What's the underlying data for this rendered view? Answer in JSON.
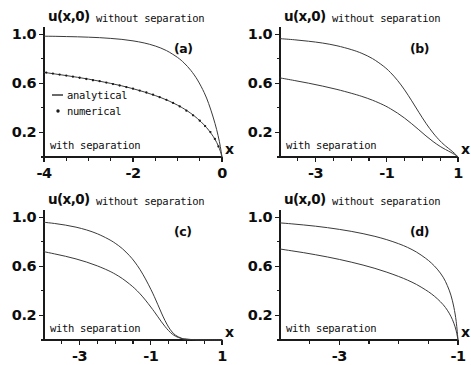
{
  "figure": {
    "background_color": "#ffffff",
    "curve_color": "#3a3a3a",
    "axis_color": "#1a1a1a",
    "text_color": "#0d0d0d"
  },
  "common": {
    "ylabel": "u(x,0)",
    "xlabel": "x",
    "label_without": "without separation",
    "label_with": "with separation",
    "ytick_labels": [
      "1.0",
      "0.6",
      "0.2"
    ],
    "ytick_values": [
      1.0,
      0.6,
      0.2
    ],
    "yminor_values": [
      0.8,
      0.4,
      0.0
    ],
    "ylim": [
      0,
      1.06
    ]
  },
  "legend": {
    "analytical_label": "analytical",
    "numerical_label": "numerical",
    "analytical_marker": "line",
    "numerical_marker": "dot"
  },
  "chart_data": [
    {
      "type": "line",
      "panel": "a",
      "tag": "(a)",
      "title": "",
      "xlabel": "x",
      "ylabel": "u(x,0)",
      "xlim": [
        -4,
        0
      ],
      "ylim": [
        0,
        1.06
      ],
      "xtick_labels": [
        "-4",
        "-2",
        "0"
      ],
      "xtick_values": [
        -4,
        -2,
        0
      ],
      "xminor_values": [
        -3.5,
        -3.0,
        -2.5,
        -1.5,
        -1.0,
        -0.5
      ],
      "grid": false,
      "annotations": [
        "without separation",
        "with separation"
      ],
      "has_legend": true,
      "series": [
        {
          "name": "without separation",
          "style": "analytical",
          "x": [
            -4.0,
            -3.75,
            -3.5,
            -3.25,
            -3.0,
            -2.75,
            -2.5,
            -2.25,
            -2.0,
            -1.75,
            -1.5,
            -1.25,
            -1.0,
            -0.85,
            -0.7,
            -0.55,
            -0.4,
            -0.3,
            -0.2,
            -0.12,
            -0.06,
            -0.02,
            0.0
          ],
          "y": [
            0.985,
            0.984,
            0.982,
            0.98,
            0.977,
            0.973,
            0.967,
            0.959,
            0.947,
            0.93,
            0.905,
            0.868,
            0.812,
            0.766,
            0.706,
            0.628,
            0.525,
            0.436,
            0.326,
            0.223,
            0.128,
            0.047,
            0.0
          ]
        },
        {
          "name": "with separation",
          "style": "analytical",
          "x": [
            -4.0,
            -3.75,
            -3.5,
            -3.25,
            -3.0,
            -2.75,
            -2.5,
            -2.25,
            -2.0,
            -1.75,
            -1.5,
            -1.25,
            -1.0,
            -0.85,
            -0.7,
            -0.55,
            -0.4,
            -0.3,
            -0.2,
            -0.12,
            -0.06,
            -0.02,
            0.0
          ],
          "y": [
            0.69,
            0.677,
            0.664,
            0.65,
            0.635,
            0.618,
            0.6,
            0.58,
            0.557,
            0.531,
            0.501,
            0.466,
            0.423,
            0.392,
            0.356,
            0.313,
            0.261,
            0.219,
            0.169,
            0.119,
            0.07,
            0.026,
            0.0
          ]
        },
        {
          "name": "with separation",
          "style": "numerical",
          "x": [
            -3.95,
            -3.8,
            -3.65,
            -3.5,
            -3.35,
            -3.2,
            -3.05,
            -2.9,
            -2.75,
            -2.6,
            -2.45,
            -2.3,
            -2.15,
            -2.0,
            -1.85,
            -1.7,
            -1.55,
            -1.4,
            -1.25,
            -1.1,
            -0.95,
            -0.8,
            -0.65,
            -0.5,
            -0.38,
            -0.26,
            -0.16,
            -0.08
          ],
          "y": [
            0.688,
            0.68,
            0.672,
            0.664,
            0.655,
            0.646,
            0.636,
            0.626,
            0.618,
            0.607,
            0.595,
            0.583,
            0.57,
            0.557,
            0.542,
            0.526,
            0.508,
            0.488,
            0.466,
            0.441,
            0.412,
            0.378,
            0.34,
            0.296,
            0.252,
            0.203,
            0.147,
            0.086
          ]
        }
      ]
    },
    {
      "type": "line",
      "panel": "b",
      "tag": "(b)",
      "title": "",
      "xlabel": "x",
      "ylabel": "u(x,0)",
      "xlim": [
        -4,
        1
      ],
      "ylim": [
        0,
        1.06
      ],
      "xtick_labels": [
        "-3",
        "-1",
        "1"
      ],
      "xtick_values": [
        -3,
        -1,
        1
      ],
      "xminor_values": [
        -3.5,
        -2.5,
        -2.0,
        -1.5,
        -0.5,
        0.0,
        0.5
      ],
      "grid": false,
      "annotations": [
        "without separation",
        "with separation"
      ],
      "has_legend": false,
      "series": [
        {
          "name": "without separation",
          "style": "analytical",
          "x": [
            -4.0,
            -3.6,
            -3.2,
            -2.8,
            -2.4,
            -2.0,
            -1.7,
            -1.4,
            -1.1,
            -0.9,
            -0.7,
            -0.5,
            -0.3,
            -0.1,
            0.1,
            0.3,
            0.5,
            0.65,
            0.8,
            0.9,
            0.96,
            1.0
          ],
          "y": [
            0.965,
            0.956,
            0.944,
            0.929,
            0.907,
            0.876,
            0.845,
            0.802,
            0.742,
            0.69,
            0.625,
            0.547,
            0.458,
            0.365,
            0.275,
            0.196,
            0.13,
            0.09,
            0.055,
            0.03,
            0.013,
            0.0
          ]
        },
        {
          "name": "with separation",
          "style": "analytical",
          "x": [
            -4.0,
            -3.6,
            -3.2,
            -2.8,
            -2.4,
            -2.0,
            -1.7,
            -1.4,
            -1.1,
            -0.9,
            -0.7,
            -0.5,
            -0.3,
            -0.1,
            0.1,
            0.3,
            0.5,
            0.65,
            0.8,
            0.9,
            0.96,
            1.0
          ],
          "y": [
            0.645,
            0.624,
            0.602,
            0.578,
            0.551,
            0.52,
            0.494,
            0.463,
            0.425,
            0.394,
            0.358,
            0.317,
            0.271,
            0.222,
            0.172,
            0.126,
            0.086,
            0.061,
            0.038,
            0.021,
            0.009,
            0.0
          ]
        }
      ]
    },
    {
      "type": "line",
      "panel": "c",
      "tag": "(c)",
      "title": "",
      "xlabel": "x",
      "ylabel": "u(x,0)",
      "xlim": [
        -4,
        1
      ],
      "ylim": [
        0,
        1.06
      ],
      "xtick_labels": [
        "-3",
        "-1",
        "1"
      ],
      "xtick_values": [
        -3,
        -1,
        1
      ],
      "xminor_values": [
        -3.5,
        -2.5,
        -2.0,
        -1.5,
        -0.5,
        0.0,
        0.5
      ],
      "grid": false,
      "annotations": [
        "without separation",
        "with separation"
      ],
      "has_legend": false,
      "series": [
        {
          "name": "without separation",
          "style": "analytical",
          "x": [
            -4.0,
            -3.7,
            -3.4,
            -3.1,
            -2.8,
            -2.5,
            -2.2,
            -2.0,
            -1.8,
            -1.6,
            -1.45,
            -1.3,
            -1.15,
            -1.0,
            -0.9,
            -0.8,
            -0.7,
            -0.6,
            -0.5,
            -0.4,
            -0.3,
            -0.15,
            0.0,
            0.3,
            0.6,
            1.0
          ],
          "y": [
            0.96,
            0.95,
            0.937,
            0.92,
            0.897,
            0.866,
            0.824,
            0.789,
            0.745,
            0.688,
            0.636,
            0.573,
            0.498,
            0.414,
            0.353,
            0.287,
            0.22,
            0.158,
            0.105,
            0.065,
            0.038,
            0.016,
            0.007,
            0.002,
            0.001,
            0.0
          ]
        },
        {
          "name": "with separation",
          "style": "analytical",
          "x": [
            -4.0,
            -3.7,
            -3.4,
            -3.1,
            -2.8,
            -2.5,
            -2.2,
            -2.0,
            -1.8,
            -1.6,
            -1.45,
            -1.3,
            -1.15,
            -1.0,
            -0.9,
            -0.8,
            -0.7,
            -0.6,
            -0.5,
            -0.4,
            -0.3,
            -0.15,
            0.0,
            0.3,
            0.6,
            1.0
          ],
          "y": [
            0.72,
            0.702,
            0.683,
            0.661,
            0.635,
            0.604,
            0.567,
            0.537,
            0.501,
            0.457,
            0.42,
            0.376,
            0.325,
            0.269,
            0.23,
            0.189,
            0.148,
            0.11,
            0.076,
            0.049,
            0.03,
            0.013,
            0.006,
            0.002,
            0.001,
            0.0
          ]
        }
      ]
    },
    {
      "type": "line",
      "panel": "d",
      "tag": "(d)",
      "title": "",
      "xlabel": "x",
      "ylabel": "u(x,0)",
      "xlim": [
        -4,
        -1
      ],
      "ylim": [
        0,
        1.06
      ],
      "xtick_labels": [
        "-3",
        "-1"
      ],
      "xtick_values": [
        -3,
        -1
      ],
      "xminor_values": [
        -3.5,
        -2.5,
        -2.0,
        -1.5
      ],
      "grid": false,
      "annotations": [
        "without separation",
        "with separation"
      ],
      "has_legend": false,
      "series": [
        {
          "name": "without separation",
          "style": "analytical",
          "x": [
            -4.0,
            -3.8,
            -3.6,
            -3.4,
            -3.2,
            -3.0,
            -2.8,
            -2.6,
            -2.4,
            -2.2,
            -2.0,
            -1.85,
            -1.7,
            -1.55,
            -1.45,
            -1.35,
            -1.25,
            -1.18,
            -1.12,
            -1.07,
            -1.03,
            -1.0
          ],
          "y": [
            0.955,
            0.947,
            0.938,
            0.928,
            0.916,
            0.902,
            0.886,
            0.867,
            0.845,
            0.818,
            0.785,
            0.755,
            0.717,
            0.668,
            0.628,
            0.578,
            0.512,
            0.444,
            0.366,
            0.268,
            0.15,
            0.0
          ]
        },
        {
          "name": "with separation",
          "style": "analytical",
          "x": [
            -4.0,
            -3.8,
            -3.6,
            -3.4,
            -3.2,
            -3.0,
            -2.8,
            -2.6,
            -2.4,
            -2.2,
            -2.0,
            -1.85,
            -1.7,
            -1.55,
            -1.45,
            -1.35,
            -1.25,
            -1.18,
            -1.12,
            -1.07,
            -1.03,
            -1.0
          ],
          "y": [
            0.742,
            0.727,
            0.712,
            0.695,
            0.677,
            0.657,
            0.635,
            0.611,
            0.584,
            0.553,
            0.518,
            0.488,
            0.453,
            0.41,
            0.377,
            0.337,
            0.288,
            0.243,
            0.193,
            0.137,
            0.074,
            0.0
          ]
        }
      ]
    }
  ]
}
